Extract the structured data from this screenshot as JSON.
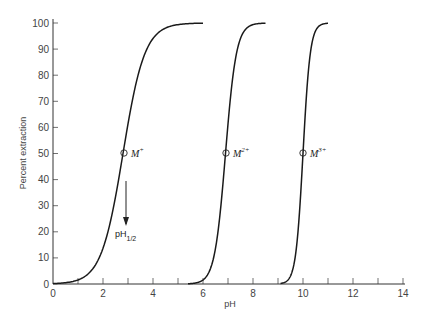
{
  "chart_data": {
    "type": "line",
    "title": "",
    "xlabel": "pH",
    "ylabel": "Percent extraction",
    "xlim": [
      0,
      14
    ],
    "ylim": [
      0,
      100
    ],
    "xticks": [
      0,
      2,
      4,
      6,
      8,
      10,
      12,
      14
    ],
    "xminor_ticks": [
      1,
      3,
      5,
      7,
      9,
      11,
      13
    ],
    "yticks": [
      0,
      10,
      20,
      30,
      40,
      50,
      60,
      70,
      80,
      90,
      100
    ],
    "grid": false,
    "legend": null,
    "series": [
      {
        "name": "M+",
        "charge": 1,
        "pH_half": 2.8,
        "x_range": [
          0,
          6.0
        ],
        "points": [
          [
            0,
            0.2
          ],
          [
            1,
            1.6
          ],
          [
            2,
            13.7
          ],
          [
            2.8,
            50
          ],
          [
            3.5,
            83
          ],
          [
            4,
            94
          ],
          [
            5,
            99.4
          ],
          [
            6,
            100
          ]
        ]
      },
      {
        "name": "M2+",
        "charge": 2,
        "pH_half": 6.9,
        "x_range": [
          5.4,
          8.5
        ],
        "points": [
          [
            5.4,
            0.1
          ],
          [
            6,
            1.6
          ],
          [
            6.5,
            13.7
          ],
          [
            6.9,
            50
          ],
          [
            7.3,
            86
          ],
          [
            7.8,
            98.4
          ],
          [
            8.5,
            100
          ]
        ]
      },
      {
        "name": "M3+",
        "charge": 3,
        "pH_half": 10.0,
        "x_range": [
          9.1,
          11.0
        ],
        "points": [
          [
            9.1,
            0.2
          ],
          [
            9.5,
            3.1
          ],
          [
            9.8,
            20
          ],
          [
            10,
            50
          ],
          [
            10.2,
            80
          ],
          [
            10.5,
            97
          ],
          [
            11,
            100
          ]
        ]
      }
    ],
    "annotations": [
      {
        "text": "M",
        "superscript": "+",
        "x": 2.8,
        "y": 50,
        "marker": "circle"
      },
      {
        "text": "M",
        "superscript": "2+",
        "x": 6.9,
        "y": 50,
        "marker": "circle"
      },
      {
        "text": "M",
        "superscript": "3+",
        "x": 10.0,
        "y": 50,
        "marker": "circle"
      },
      {
        "text": "pH",
        "subscript": "1/2",
        "arrow_from": [
          2.9,
          40
        ],
        "arrow_to": [
          2.9,
          22
        ]
      }
    ]
  },
  "labels": {
    "xlabel": "pH",
    "ylabel": "Percent extraction",
    "m1": "M",
    "m1_sup": "+",
    "m2": "M",
    "m2_sup": "2+",
    "m3": "M",
    "m3_sup": "3+",
    "phhalf": "pH",
    "phhalf_sub": "1/2"
  },
  "style": {
    "line_color": "#1a1a1a",
    "axis_color": "#333333"
  }
}
